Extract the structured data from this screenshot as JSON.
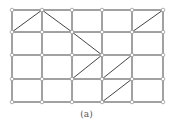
{
  "caption": "(a)",
  "grid": {
    "xs": [
      12,
      42,
      72,
      102,
      132,
      163
    ],
    "ys": [
      10,
      32,
      55,
      79,
      102
    ]
  },
  "diagonals": [
    [
      0,
      1,
      1,
      0
    ],
    [
      1,
      0,
      2,
      1
    ],
    [
      2,
      1,
      3,
      2
    ],
    [
      4,
      1,
      5,
      0
    ],
    [
      2,
      3,
      3,
      2
    ],
    [
      3,
      3,
      4,
      2
    ],
    [
      3,
      4,
      4,
      3
    ]
  ],
  "colors": {
    "line": "#444444",
    "node": "#999999"
  }
}
